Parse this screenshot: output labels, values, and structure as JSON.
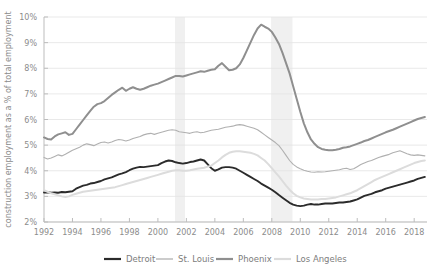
{
  "chart_data": {
    "type": "line",
    "title": "",
    "subtitle": "",
    "xlabel": "",
    "ylabel": "construction employment as a % of total employment",
    "xlim": [
      1992,
      2018.9
    ],
    "ylim": [
      2,
      10
    ],
    "grid": true,
    "legend_position": "bottom",
    "y_tick_labels": [
      "2%",
      "3%",
      "4%",
      "5%",
      "6%",
      "7%",
      "8%",
      "9%",
      "10%"
    ],
    "y_ticks": [
      2,
      3,
      4,
      5,
      6,
      7,
      8,
      9,
      10
    ],
    "x_tick_labels": [
      "1992",
      "1994",
      "1996",
      "1998",
      "2000",
      "2002",
      "2004",
      "2006",
      "2008",
      "2010",
      "2012",
      "2014",
      "2016",
      "2018"
    ],
    "x_ticks": [
      1992,
      1994,
      1996,
      1998,
      2000,
      2002,
      2004,
      2006,
      2008,
      2010,
      2012,
      2014,
      2016,
      2018
    ],
    "annotations": [
      {
        "type": "recession-band",
        "label": "2001 recession",
        "start": 2001.2,
        "end": 2001.9
      },
      {
        "type": "recession-band",
        "label": "2008 recession",
        "start": 2007.95,
        "end": 2009.45
      }
    ],
    "colors": {
      "detroit": "#2b2b2b",
      "st_louis": "#b0b0b0",
      "phoenix": "#8f8f8f",
      "los_angeles": "#dcdcdc",
      "gridline": "#e3e3e3",
      "axis": "#bdbdbd",
      "text": "#8c8c8c",
      "recession_band": "#f0f0f0"
    },
    "x": [
      1992.0,
      1992.25,
      1992.5,
      1992.75,
      1993.0,
      1993.25,
      1993.5,
      1993.75,
      1994.0,
      1994.25,
      1994.5,
      1994.75,
      1995.0,
      1995.25,
      1995.5,
      1995.75,
      1996.0,
      1996.25,
      1996.5,
      1996.75,
      1997.0,
      1997.25,
      1997.5,
      1997.75,
      1998.0,
      1998.25,
      1998.5,
      1998.75,
      1999.0,
      1999.25,
      1999.5,
      1999.75,
      2000.0,
      2000.25,
      2000.5,
      2000.75,
      2001.0,
      2001.25,
      2001.5,
      2001.75,
      2002.0,
      2002.25,
      2002.5,
      2002.75,
      2003.0,
      2003.25,
      2003.5,
      2003.75,
      2004.0,
      2004.25,
      2004.5,
      2004.75,
      2005.0,
      2005.25,
      2005.5,
      2005.75,
      2006.0,
      2006.25,
      2006.5,
      2006.75,
      2007.0,
      2007.25,
      2007.5,
      2007.75,
      2008.0,
      2008.25,
      2008.5,
      2008.75,
      2009.0,
      2009.25,
      2009.5,
      2009.75,
      2010.0,
      2010.25,
      2010.5,
      2010.75,
      2011.0,
      2011.25,
      2011.5,
      2011.75,
      2012.0,
      2012.25,
      2012.5,
      2012.75,
      2013.0,
      2013.25,
      2013.5,
      2013.75,
      2014.0,
      2014.25,
      2014.5,
      2014.75,
      2015.0,
      2015.25,
      2015.5,
      2015.75,
      2016.0,
      2016.25,
      2016.5,
      2016.75,
      2017.0,
      2017.25,
      2017.5,
      2017.75,
      2018.0,
      2018.25,
      2018.5,
      2018.75
    ],
    "series": [
      {
        "name": "Detroit",
        "color": "#2b2b2b",
        "width": 1.9,
        "values": [
          3.15,
          3.16,
          3.14,
          3.15,
          3.14,
          3.17,
          3.16,
          3.18,
          3.2,
          3.3,
          3.36,
          3.42,
          3.45,
          3.5,
          3.52,
          3.56,
          3.6,
          3.66,
          3.7,
          3.74,
          3.8,
          3.86,
          3.9,
          3.95,
          4.02,
          4.08,
          4.12,
          4.15,
          4.14,
          4.16,
          4.18,
          4.2,
          4.22,
          4.3,
          4.36,
          4.4,
          4.38,
          4.33,
          4.3,
          4.28,
          4.3,
          4.34,
          4.36,
          4.4,
          4.44,
          4.4,
          4.25,
          4.1,
          4.0,
          4.05,
          4.12,
          4.14,
          4.14,
          4.12,
          4.08,
          4.0,
          3.92,
          3.84,
          3.76,
          3.68,
          3.6,
          3.5,
          3.42,
          3.34,
          3.26,
          3.16,
          3.05,
          2.95,
          2.85,
          2.75,
          2.68,
          2.64,
          2.62,
          2.64,
          2.68,
          2.7,
          2.68,
          2.68,
          2.7,
          2.72,
          2.72,
          2.72,
          2.74,
          2.76,
          2.76,
          2.78,
          2.8,
          2.84,
          2.88,
          2.95,
          3.02,
          3.06,
          3.1,
          3.16,
          3.2,
          3.24,
          3.3,
          3.34,
          3.38,
          3.42,
          3.46,
          3.5,
          3.54,
          3.58,
          3.62,
          3.68,
          3.72,
          3.76
        ]
      },
      {
        "name": "St. Louis",
        "color": "#b0b0b0",
        "width": 1.1,
        "values": [
          4.52,
          4.46,
          4.5,
          4.56,
          4.62,
          4.58,
          4.64,
          4.72,
          4.8,
          4.86,
          4.92,
          5.0,
          5.05,
          5.02,
          4.98,
          5.04,
          5.1,
          5.12,
          5.08,
          5.12,
          5.18,
          5.22,
          5.2,
          5.16,
          5.2,
          5.26,
          5.3,
          5.34,
          5.4,
          5.44,
          5.46,
          5.42,
          5.46,
          5.5,
          5.54,
          5.58,
          5.6,
          5.58,
          5.52,
          5.5,
          5.48,
          5.46,
          5.5,
          5.52,
          5.48,
          5.5,
          5.54,
          5.58,
          5.6,
          5.62,
          5.66,
          5.7,
          5.72,
          5.74,
          5.78,
          5.8,
          5.78,
          5.74,
          5.7,
          5.66,
          5.6,
          5.5,
          5.4,
          5.3,
          5.2,
          5.1,
          4.98,
          4.8,
          4.6,
          4.4,
          4.25,
          4.15,
          4.08,
          4.02,
          3.98,
          3.95,
          3.94,
          3.96,
          3.95,
          3.96,
          3.98,
          4.0,
          4.02,
          4.04,
          4.08,
          4.1,
          4.05,
          4.08,
          4.16,
          4.24,
          4.3,
          4.36,
          4.4,
          4.46,
          4.52,
          4.56,
          4.6,
          4.64,
          4.7,
          4.74,
          4.78,
          4.72,
          4.66,
          4.62,
          4.6,
          4.62,
          4.6,
          4.58
        ]
      },
      {
        "name": "Phoenix",
        "color": "#8f8f8f",
        "width": 2.0,
        "values": [
          5.3,
          5.24,
          5.22,
          5.34,
          5.42,
          5.46,
          5.5,
          5.4,
          5.44,
          5.62,
          5.8,
          5.98,
          6.16,
          6.34,
          6.5,
          6.6,
          6.64,
          6.72,
          6.84,
          6.96,
          7.06,
          7.16,
          7.24,
          7.12,
          7.2,
          7.26,
          7.2,
          7.16,
          7.2,
          7.26,
          7.32,
          7.36,
          7.4,
          7.46,
          7.52,
          7.58,
          7.64,
          7.7,
          7.7,
          7.68,
          7.72,
          7.76,
          7.8,
          7.84,
          7.88,
          7.86,
          7.9,
          7.94,
          7.96,
          8.1,
          8.2,
          8.06,
          7.92,
          7.94,
          8.0,
          8.15,
          8.4,
          8.7,
          9.0,
          9.3,
          9.55,
          9.7,
          9.62,
          9.55,
          9.42,
          9.2,
          8.95,
          8.6,
          8.2,
          7.8,
          7.3,
          6.8,
          6.3,
          5.85,
          5.5,
          5.22,
          5.05,
          4.92,
          4.85,
          4.82,
          4.8,
          4.8,
          4.82,
          4.85,
          4.9,
          4.92,
          4.95,
          5.0,
          5.05,
          5.1,
          5.16,
          5.2,
          5.26,
          5.32,
          5.38,
          5.44,
          5.5,
          5.55,
          5.6,
          5.66,
          5.72,
          5.78,
          5.84,
          5.9,
          5.96,
          6.02,
          6.06,
          6.1
        ]
      },
      {
        "name": "Los Angeles",
        "color": "#dcdcdc",
        "width": 2.0,
        "values": [
          3.24,
          3.18,
          3.12,
          3.08,
          3.04,
          3.0,
          2.98,
          3.0,
          3.06,
          3.1,
          3.14,
          3.18,
          3.2,
          3.22,
          3.24,
          3.26,
          3.28,
          3.3,
          3.32,
          3.34,
          3.36,
          3.4,
          3.44,
          3.48,
          3.52,
          3.56,
          3.6,
          3.64,
          3.68,
          3.72,
          3.76,
          3.8,
          3.84,
          3.88,
          3.92,
          3.96,
          4.0,
          4.02,
          4.02,
          4.0,
          4.0,
          4.02,
          4.05,
          4.08,
          4.1,
          4.12,
          4.16,
          4.2,
          4.3,
          4.4,
          4.52,
          4.62,
          4.7,
          4.74,
          4.76,
          4.76,
          4.74,
          4.72,
          4.7,
          4.66,
          4.6,
          4.5,
          4.4,
          4.26,
          4.1,
          3.94,
          3.78,
          3.6,
          3.42,
          3.26,
          3.12,
          3.02,
          2.96,
          2.92,
          2.9,
          2.88,
          2.88,
          2.88,
          2.9,
          2.9,
          2.92,
          2.94,
          2.96,
          3.0,
          3.04,
          3.08,
          3.12,
          3.18,
          3.24,
          3.32,
          3.4,
          3.48,
          3.56,
          3.64,
          3.7,
          3.76,
          3.82,
          3.88,
          3.94,
          4.0,
          4.06,
          4.12,
          4.18,
          4.24,
          4.3,
          4.34,
          4.38,
          4.4
        ]
      }
    ]
  },
  "legend": {
    "items": [
      {
        "label": "Detroit",
        "color": "#2b2b2b",
        "width": 2.2
      },
      {
        "label": "St. Louis",
        "color": "#b0b0b0",
        "width": 1.3
      },
      {
        "label": "Phoenix",
        "color": "#8f8f8f",
        "width": 2.2
      },
      {
        "label": "Los Angeles",
        "color": "#dcdcdc",
        "width": 2.2
      }
    ]
  }
}
